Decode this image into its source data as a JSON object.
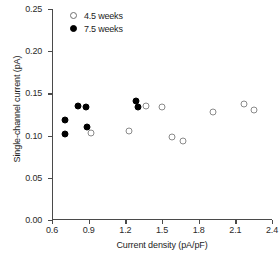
{
  "chart_data": {
    "type": "scatter",
    "title": "",
    "xlabel": "Current density (pA/pF)",
    "ylabel": "Single-channel current (pA)",
    "xlim": [
      0.6,
      2.4
    ],
    "ylim": [
      0.0,
      0.25
    ],
    "xticks": [
      0.6,
      0.9,
      1.2,
      1.5,
      1.8,
      2.1,
      2.4
    ],
    "xtick_labels": [
      "0.6",
      "0.9",
      "1.2",
      "1.5",
      "1.8",
      "2.1",
      "2.4"
    ],
    "yticks": [
      0.0,
      0.05,
      0.1,
      0.15,
      0.2,
      0.25
    ],
    "ytick_labels": [
      "0.00",
      "0.05",
      "0.10",
      "0.15",
      "0.20",
      "0.25"
    ],
    "grid": false,
    "legend_position": "top-left",
    "series": [
      {
        "name": "4.5 weeks",
        "marker": "open-circle",
        "color": "#ffffff",
        "edge_color": "#8a8a8a",
        "points": [
          {
            "x": 0.92,
            "y": 0.103
          },
          {
            "x": 1.23,
            "y": 0.106
          },
          {
            "x": 1.37,
            "y": 0.135
          },
          {
            "x": 1.5,
            "y": 0.134
          },
          {
            "x": 1.58,
            "y": 0.098
          },
          {
            "x": 1.67,
            "y": 0.094
          },
          {
            "x": 1.92,
            "y": 0.128
          },
          {
            "x": 2.17,
            "y": 0.138
          },
          {
            "x": 2.25,
            "y": 0.13
          }
        ]
      },
      {
        "name": "7.5 weeks",
        "marker": "filled-circle",
        "color": "#000000",
        "edge_color": "#000000",
        "points": [
          {
            "x": 0.71,
            "y": 0.118
          },
          {
            "x": 0.71,
            "y": 0.102
          },
          {
            "x": 0.81,
            "y": 0.135
          },
          {
            "x": 0.88,
            "y": 0.134
          },
          {
            "x": 0.89,
            "y": 0.11
          },
          {
            "x": 1.29,
            "y": 0.141
          },
          {
            "x": 1.3,
            "y": 0.134
          }
        ]
      }
    ]
  },
  "legend": {
    "entries": [
      {
        "label": "4.5 weeks",
        "marker": "open-circle"
      },
      {
        "label": "7.5 weeks",
        "marker": "filled-circle"
      }
    ]
  },
  "axes": {
    "x_title": "Current density (pA/pF)",
    "y_title": "Single-channel current (pA)"
  }
}
